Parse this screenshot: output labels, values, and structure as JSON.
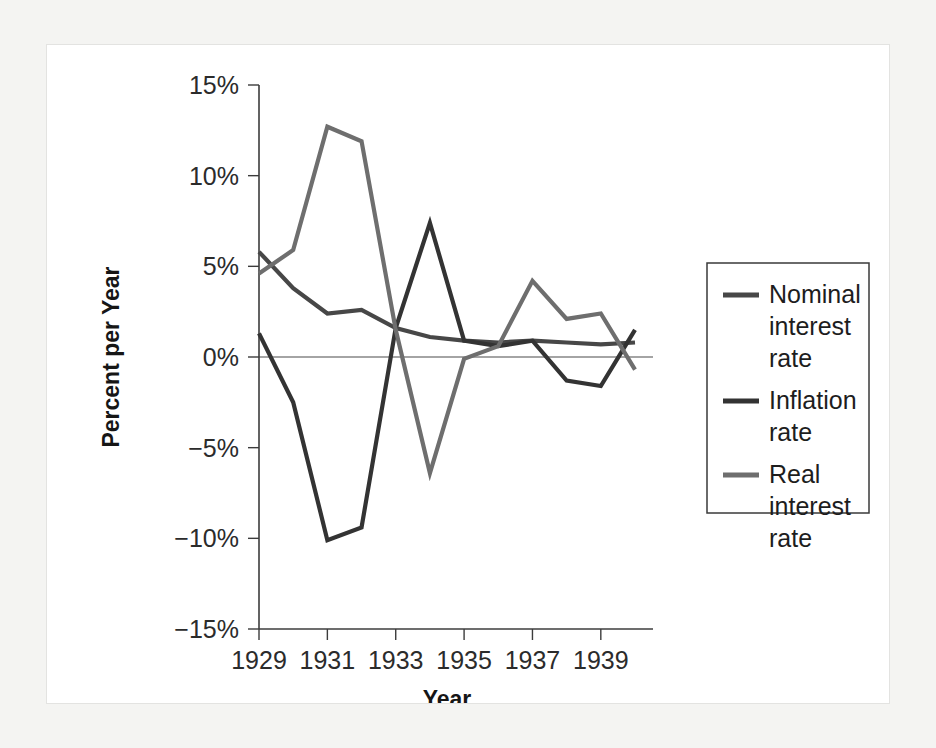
{
  "chart_data": {
    "type": "line",
    "title": "",
    "xlabel": "Year",
    "ylabel": "Percent per Year",
    "x": [
      1929,
      1930,
      1931,
      1932,
      1933,
      1934,
      1935,
      1936,
      1937,
      1938,
      1939,
      1940
    ],
    "xlim": [
      1929,
      1940
    ],
    "ylim": [
      -15,
      15
    ],
    "xticks": [
      1929,
      1931,
      1933,
      1935,
      1937,
      1939
    ],
    "xtick_labels": [
      "1929",
      "1931",
      "1933",
      "1935",
      "1937",
      "1939"
    ],
    "yticks": [
      -15,
      -10,
      -5,
      0,
      5,
      10,
      15
    ],
    "ytick_labels": [
      "−15%",
      "−10%",
      "−5%",
      "0%",
      "5%",
      "10%",
      "15%"
    ],
    "grid": false,
    "zero_line": true,
    "legend_position": "right",
    "series": [
      {
        "name": "Nominal interest rate",
        "color": "#474747",
        "values": [
          5.8,
          3.8,
          2.4,
          2.6,
          1.6,
          1.1,
          0.9,
          0.8,
          0.9,
          0.8,
          0.7,
          0.8
        ]
      },
      {
        "name": "Inflation rate",
        "color": "#333333",
        "values": [
          1.3,
          -2.5,
          -10.1,
          -9.4,
          1.6,
          7.4,
          0.9,
          0.6,
          0.9,
          -1.3,
          -1.6,
          1.5
        ]
      },
      {
        "name": "Real interest rate",
        "color": "#6e6e6e",
        "values": [
          4.6,
          5.9,
          12.7,
          11.9,
          1.5,
          -6.4,
          -0.1,
          0.6,
          4.2,
          2.1,
          2.4,
          -0.7
        ]
      }
    ]
  },
  "legend": {
    "entries": [
      {
        "label_line1": "Nominal",
        "label_line2": "interest",
        "label_line3": "rate"
      },
      {
        "label_line1": "Inflation",
        "label_line2": "rate",
        "label_line3": ""
      },
      {
        "label_line1": "Real",
        "label_line2": "interest",
        "label_line3": "rate"
      }
    ]
  }
}
